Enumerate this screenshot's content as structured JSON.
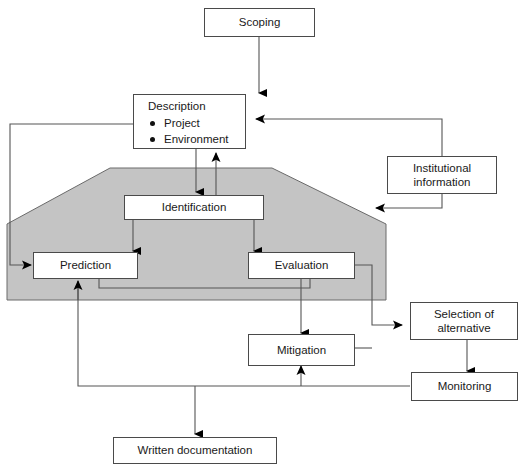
{
  "diagram": {
    "colors": {
      "shaded_region_fill": "#c4c4c4",
      "shaded_region_stroke": "#555555",
      "box_stroke": "#4a4a4a",
      "box_fill": "#ffffff",
      "connector_stroke": "#555555",
      "arrowhead_fill": "#000000",
      "text": "#1a1a1a",
      "background": "#ffffff"
    },
    "shaded_region": {
      "name": "impact-assessment-zone",
      "shape": "pentagon-chamfered-top-corners"
    }
  },
  "nodes": {
    "scoping": {
      "label": "Scoping"
    },
    "description": {
      "title": "Description",
      "bullets": [
        "Project",
        "Environment"
      ]
    },
    "institutional_information": {
      "line1": "Institutional",
      "line2": "information"
    },
    "identification": {
      "label": "Identification"
    },
    "prediction": {
      "label": "Prediction"
    },
    "evaluation": {
      "label": "Evaluation"
    },
    "mitigation": {
      "label": "Mitigation"
    },
    "selection_of_alternative": {
      "line1": "Selection of",
      "line2": "alternative"
    },
    "monitoring": {
      "label": "Monitoring"
    },
    "written_documentation": {
      "label": "Written documentation"
    }
  },
  "connections": [
    {
      "from": "scoping",
      "to": "description",
      "style": "arrow-down"
    },
    {
      "from": "description",
      "to": "identification",
      "style": "arrow-down"
    },
    {
      "from": "identification",
      "to": "description",
      "style": "arrow-up"
    },
    {
      "from": "identification",
      "to": "prediction",
      "style": "arrow-down-left"
    },
    {
      "from": "identification",
      "to": "evaluation",
      "style": "arrow-down-right"
    },
    {
      "from": "description",
      "to": "prediction",
      "style": "left-loop-arrow"
    },
    {
      "from": "institutional_information",
      "to": "description",
      "style": "arrow-left"
    },
    {
      "from": "institutional_information",
      "to": "shaded_region",
      "style": "arrow-left"
    },
    {
      "from": "evaluation",
      "to": "prediction",
      "style": "feedback-arrow-left"
    },
    {
      "from": "evaluation",
      "to": "mitigation",
      "style": "arrow-down"
    },
    {
      "from": "evaluation",
      "to": "selection_of_alternative",
      "style": "arrow-right"
    },
    {
      "from": "mitigation",
      "to": "selection_of_alternative",
      "style": "arrow-right"
    },
    {
      "from": "selection_of_alternative",
      "to": "monitoring",
      "style": "arrow-down"
    },
    {
      "from": "monitoring",
      "to": "mitigation",
      "style": "feedback-arrow-up"
    },
    {
      "from": "monitoring",
      "to": "prediction",
      "style": "feedback-arrow-up"
    },
    {
      "from": "monitoring",
      "to": "written_documentation",
      "style": "arrow-down"
    }
  ]
}
